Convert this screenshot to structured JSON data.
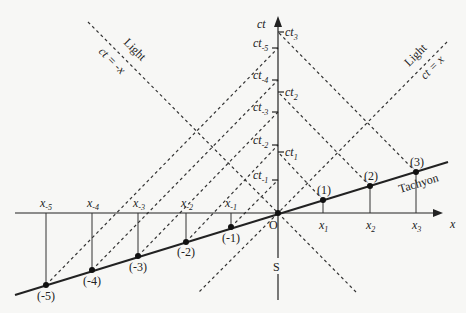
{
  "diagram": {
    "axes": {
      "time_label": "ct",
      "space_label": "x",
      "origin_label": "O",
      "frame_label": "S"
    },
    "light_lines": [
      {
        "name": "Light",
        "equation": "ct = -x",
        "direction": "left"
      },
      {
        "name": "Light",
        "equation": "ct = x",
        "direction": "right"
      }
    ],
    "worldline_label": "Tachyon",
    "events": [
      {
        "label": "(-5)",
        "x_label": "x",
        "x_sub": "-5",
        "ct_label": "ct",
        "ct_sub": "-5"
      },
      {
        "label": "(-4)",
        "x_label": "x",
        "x_sub": "-4",
        "ct_label": "ct",
        "ct_sub": "-4"
      },
      {
        "label": "(-3)",
        "x_label": "x",
        "x_sub": "-3",
        "ct_label": "ct",
        "ct_sub": "-3"
      },
      {
        "label": "(-2)",
        "x_label": "x",
        "x_sub": "-2",
        "ct_label": "ct",
        "ct_sub": "-2"
      },
      {
        "label": "(-1)",
        "x_label": "x",
        "x_sub": "-1",
        "ct_label": "ct",
        "ct_sub": "-1"
      },
      {
        "label": "(1)",
        "x_label": "x",
        "x_sub": "1",
        "ct_label": "ct",
        "ct_sub": "1"
      },
      {
        "label": "(2)",
        "x_label": "x",
        "x_sub": "2",
        "ct_label": "ct",
        "ct_sub": "2"
      },
      {
        "label": "(3)",
        "x_label": "x",
        "x_sub": "3",
        "ct_label": "ct",
        "ct_sub": "3"
      }
    ]
  }
}
